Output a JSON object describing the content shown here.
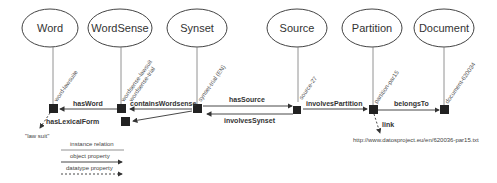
{
  "classes": [
    {
      "id": "word",
      "label": "Word",
      "cx": 50,
      "cy": 28
    },
    {
      "id": "wordsense",
      "label": "WordSense",
      "cx": 120,
      "cy": 28
    },
    {
      "id": "synset",
      "label": "Synset",
      "cx": 197,
      "cy": 28
    },
    {
      "id": "source",
      "label": "Source",
      "cx": 296,
      "cy": 28
    },
    {
      "id": "partition",
      "label": "Partition",
      "cx": 372,
      "cy": 28
    },
    {
      "id": "document",
      "label": "Document",
      "cx": 444,
      "cy": 28
    }
  ],
  "instances": {
    "word": "word-lawsuite",
    "wordsense1": "wordsense-lawsuit",
    "wordsense2": "wordsense-trial",
    "synset": "synset-trial (EN)",
    "source": "source-27",
    "partition": "partition-par15",
    "document": "document-620034"
  },
  "relations": {
    "hasWord": "hasWord",
    "containsWordsense": "containsWordsense",
    "hasSource": "hasSource",
    "involvesSynset": "involvesSynset",
    "involvesPartition": "involvesPartition",
    "belongsTo": "belongsTo",
    "hasLexicalForm": "hasLexicalForm",
    "link": "link"
  },
  "literals": {
    "lexical_form": "\"law suit\"",
    "url": "http://www.datosproject.eu/en/620036-par15.txt"
  },
  "legend": {
    "instance_relation": "instance relation",
    "object_property": "object property",
    "datatype_property": "datatype property"
  },
  "colors": {
    "node": "#222222",
    "line": "#555555",
    "ellipse_stroke": "#444444"
  }
}
